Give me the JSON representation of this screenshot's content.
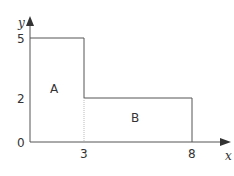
{
  "diagram": {
    "axes": {
      "x_label": "x",
      "y_label": "y",
      "origin_label": "0"
    },
    "x_ticks": [
      "3",
      "8"
    ],
    "y_ticks": [
      "5",
      "2"
    ],
    "regions": [
      {
        "label": "A",
        "x_from": 0,
        "x_to": 3,
        "height": 5
      },
      {
        "label": "B",
        "x_from": 3,
        "x_to": 8,
        "height": 2
      }
    ],
    "colors": {
      "line": "#555555",
      "dotted": "#bbbbbb"
    }
  }
}
